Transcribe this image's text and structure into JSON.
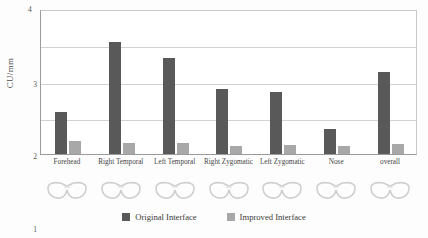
{
  "chart_data": {
    "type": "bar",
    "title": "",
    "xlabel": "",
    "ylabel": "CU/mm",
    "ylim": [
      0,
      4
    ],
    "yticks": [
      "1",
      "2",
      "3",
      "4"
    ],
    "grid": true,
    "legend_position": "bottom",
    "categories": [
      "Forehead",
      "Right Temporal",
      "Left Temporal",
      "Right Zygomatic",
      "Left Zygomatic",
      "Nose",
      "overall"
    ],
    "series": [
      {
        "name": "Original Interface",
        "color": "#595959",
        "values": [
          1.15,
          3.1,
          2.65,
          1.8,
          1.7,
          0.68,
          2.25
        ]
      },
      {
        "name": "Improved Interface",
        "color": "#a8a8a8",
        "values": [
          0.35,
          0.3,
          0.3,
          0.22,
          0.25,
          0.22,
          0.28
        ]
      }
    ]
  },
  "legend": {
    "items": [
      {
        "label": "Original Interface"
      },
      {
        "label": "Improved Interface"
      }
    ]
  },
  "icons": {
    "goggles_name": "safety-goggles-icon",
    "count": 7
  }
}
